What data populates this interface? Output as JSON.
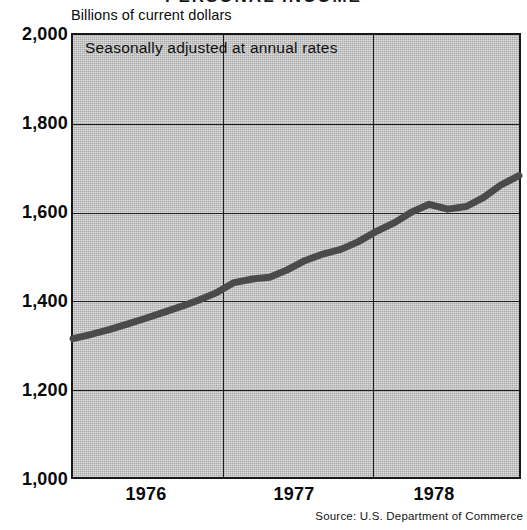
{
  "chart": {
    "title": "PERSONAL INCOME",
    "unit_label": "Billions of current dollars",
    "plot_note": "Seasonally adjusted at annual rates",
    "source": "Source: U.S. Department of Commerce",
    "line_color": "#4a4a4a",
    "plot_background": "#b9b9b9",
    "axis_color": "#1d1d1d"
  },
  "chart_data": {
    "type": "line",
    "title": "PERSONAL INCOME",
    "subtitle": "Seasonally adjusted at annual rates",
    "xlabel": "",
    "ylabel": "Billions of current dollars",
    "ylim": [
      1000,
      2000
    ],
    "xlim": [
      1975.62,
      1978.75
    ],
    "grid": true,
    "legend": "none",
    "ytick_labels": [
      "2,000",
      "1,800",
      "1,600",
      "1,400",
      "1,200",
      "1,000"
    ],
    "ytick_values": [
      2000,
      1800,
      1600,
      1400,
      1200,
      1000
    ],
    "xtick_labels": [
      "1976",
      "1977",
      "1978"
    ],
    "xtick_values": [
      1976.0,
      1977.0,
      1978.0
    ],
    "x_gridline_values": [
      1976.5,
      1977.5
    ],
    "series": [
      {
        "name": "Personal income",
        "x": [
          1975.62,
          1975.75,
          1975.88,
          1976.0,
          1976.12,
          1976.25,
          1976.38,
          1976.5,
          1976.62,
          1976.75,
          1976.88,
          1977.0,
          1977.12,
          1977.25,
          1977.38,
          1977.5,
          1977.62,
          1977.75,
          1977.88,
          1978.0,
          1978.12,
          1978.25,
          1978.38,
          1978.5,
          1978.62,
          1978.75
        ],
        "values": [
          1313,
          1323,
          1334,
          1346,
          1358,
          1372,
          1386,
          1400,
          1416,
          1440,
          1448,
          1452,
          1468,
          1490,
          1505,
          1515,
          1532,
          1556,
          1576,
          1600,
          1617,
          1606,
          1612,
          1632,
          1660,
          1682
        ]
      }
    ],
    "series_endpoints": {
      "start_value": 1313,
      "end_value": 1730
    },
    "annotations": []
  }
}
